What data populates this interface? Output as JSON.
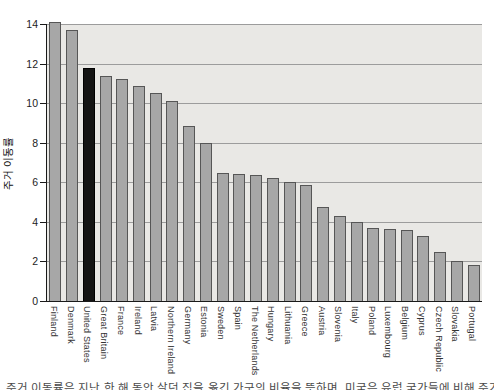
{
  "figure": {
    "background": "#ffffff",
    "plot_background": "#e9e8e5",
    "bar_color": "#a7a7a7",
    "bar_border_color": "#565656",
    "highlight_bar_color": "#141414",
    "gridline_color": "#9c9c9c",
    "axis_color": "#1a1a1a",
    "y_axis_title": "주거 이동률"
  },
  "chart_data": {
    "type": "bar",
    "title": "",
    "xlabel": "",
    "ylabel": "주거 이동률",
    "ylim": [
      0,
      14
    ],
    "ytick_step": 2,
    "grid": true,
    "legend": "none",
    "highlight_category": "United States",
    "highlight_index": 2,
    "categories": [
      "Finland",
      "Denmark",
      "United States",
      "Great Britain",
      "France",
      "Ireland",
      "Latvia",
      "Northern Ireland",
      "Germany",
      "Estonia",
      "Sweden",
      "Spain",
      "The Netherlands",
      "Hungary",
      "Lithuania",
      "Greece",
      "Austria",
      "Slovenia",
      "Italy",
      "Poland",
      "Luxembourg",
      "Belgium",
      "Cyprus",
      "Czech Republic",
      "Slovakia",
      "Portugal"
    ],
    "values": [
      14.1,
      13.7,
      11.8,
      11.35,
      11.2,
      10.85,
      10.5,
      10.1,
      8.85,
      8.0,
      6.45,
      6.4,
      6.35,
      6.2,
      6.0,
      5.85,
      4.75,
      4.3,
      4.0,
      3.7,
      3.65,
      3.6,
      3.3,
      2.5,
      2.0,
      1.8
    ]
  },
  "caption": {
    "text": "주거 이동률은 지난 한 해 동안 살던 집을 옮긴 가구의 비율을 뜻하며, 미국은 유럽 국가들에 비해 주거 이동률이 높은 편이다."
  }
}
